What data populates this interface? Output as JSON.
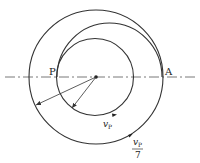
{
  "diagram": {
    "type": "orbital-transfer",
    "labels": {
      "point_p": "P",
      "point_a": "A",
      "inner_velocity_symbol": "v",
      "inner_velocity_subscript": "P",
      "outer_velocity_numerator_symbol": "v",
      "outer_velocity_numerator_subscript": "P",
      "outer_velocity_denominator": "7"
    },
    "elements": {
      "inner_circle": "inner circular orbit",
      "outer_circle": "outer circular orbit",
      "transfer_arc": "elliptical transfer arc from P to A",
      "axis": "dash-dot horizontal axis through center",
      "center": "central body"
    },
    "colors": {
      "stroke": "#333333",
      "background": "#ffffff"
    }
  }
}
